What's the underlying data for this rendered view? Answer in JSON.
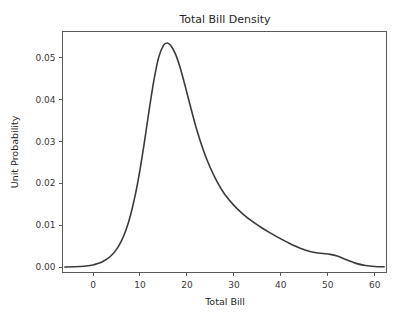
{
  "chart_data": {
    "type": "line",
    "title": "Total Bill Density",
    "xlabel": "Total Bill",
    "ylabel": "Unit Probability",
    "xlim": [
      -6.5,
      62.5
    ],
    "ylim": [
      -0.0013,
      0.0562
    ],
    "xticks": [
      0,
      10,
      20,
      30,
      40,
      50,
      60
    ],
    "xtick_labels": [
      "0",
      "10",
      "20",
      "30",
      "40",
      "50",
      "60"
    ],
    "yticks": [
      0.0,
      0.01,
      0.02,
      0.03,
      0.04,
      0.05
    ],
    "ytick_labels": [
      "0.00",
      "0.01",
      "0.02",
      "0.03",
      "0.04",
      "0.05"
    ],
    "grid": false,
    "legend": false,
    "series": [
      {
        "name": "Total Bill density",
        "color": "#3b3b3b",
        "linewidth": 1.6,
        "x": [
          -6.0,
          -4.0,
          -2.0,
          0.0,
          1.0,
          2.0,
          3.0,
          4.0,
          5.0,
          6.0,
          7.0,
          8.0,
          9.0,
          10.0,
          11.0,
          12.0,
          13.0,
          14.0,
          15.0,
          15.8,
          16.5,
          17.5,
          18.5,
          19.5,
          20.5,
          22.0,
          23.5,
          25.0,
          26.5,
          28.0,
          30.0,
          32.0,
          34.0,
          36.0,
          38.0,
          40.0,
          42.0,
          44.0,
          46.0,
          47.5,
          49.0,
          50.5,
          52.0,
          54.0,
          56.0,
          58.0,
          60.0,
          62.0
        ],
        "y": [
          2e-05,
          6e-05,
          0.00018,
          0.0005,
          0.00082,
          0.00128,
          0.00194,
          0.00288,
          0.00422,
          0.00612,
          0.00878,
          0.01242,
          0.0172,
          0.02318,
          0.03022,
          0.03778,
          0.04478,
          0.05008,
          0.05288,
          0.05345,
          0.05292,
          0.05098,
          0.04778,
          0.04372,
          0.03938,
          0.03312,
          0.02788,
          0.02362,
          0.02018,
          0.01742,
          0.01472,
          0.01258,
          0.01082,
          0.00932,
          0.00798,
          0.00672,
          0.00558,
          0.00456,
          0.00378,
          0.00342,
          0.00322,
          0.00302,
          0.00262,
          0.00172,
          0.00088,
          0.00038,
          0.00014,
          6e-05
        ]
      }
    ],
    "peak": {
      "x": 15.8,
      "y": 0.0535
    }
  },
  "figure": {
    "background_color": "#ffffff",
    "axes_color": "#5a5a5a",
    "text_color": "#262626"
  }
}
